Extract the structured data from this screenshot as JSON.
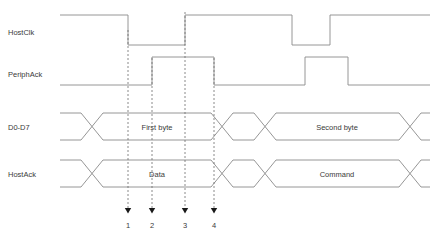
{
  "diagram": {
    "type": "timing-diagram",
    "width": 430,
    "height": 240,
    "background_color": "#ffffff",
    "wave_color": "#8a8a8a",
    "text_color": "#3a3a3a",
    "marker_color": "#6d6d6d",
    "signals": [
      {
        "name": "HostClk",
        "label": "HostClk",
        "kind": "clock",
        "high_y": 15,
        "low_y": 45,
        "start_x": 60,
        "end_x": 430,
        "initial_level": "high",
        "transitions": [
          {
            "x": 128,
            "to": "low",
            "at_marker": 1
          },
          {
            "x": 185,
            "to": "high",
            "at_marker": 3
          },
          {
            "x": 292,
            "to": "low"
          },
          {
            "x": 330,
            "to": "high"
          }
        ]
      },
      {
        "name": "PeriphAck",
        "label": "PeriphAck",
        "kind": "level",
        "high_y": 57,
        "low_y": 85,
        "start_x": 60,
        "end_x": 430,
        "initial_level": "low",
        "transitions": [
          {
            "x": 152,
            "to": "high",
            "at_marker": 2
          },
          {
            "x": 214,
            "to": "low",
            "at_marker": 4
          },
          {
            "x": 305,
            "to": "high"
          },
          {
            "x": 348,
            "to": "low"
          }
        ]
      },
      {
        "name": "D0-D7",
        "label": "D0-D7",
        "kind": "bus",
        "top_y": 113,
        "bottom_y": 140,
        "start_x": 60,
        "end_x": 430,
        "crossings": [
          92,
          222,
          265,
          410
        ],
        "segments": [
          {
            "label": "",
            "center_x": 76
          },
          {
            "label": "First byte",
            "center_x": 157
          },
          {
            "label": "",
            "center_x": 243
          },
          {
            "label": "Second byte",
            "center_x": 337
          }
        ]
      },
      {
        "name": "HostAck",
        "label": "HostAck",
        "kind": "bus",
        "top_y": 160,
        "bottom_y": 187,
        "start_x": 60,
        "end_x": 430,
        "crossings": [
          92,
          222,
          265,
          410
        ],
        "segments": [
          {
            "label": "",
            "center_x": 76
          },
          {
            "label": "Data",
            "center_x": 157
          },
          {
            "label": "",
            "center_x": 243
          },
          {
            "label": "Command",
            "center_x": 337
          }
        ]
      }
    ],
    "markers": [
      {
        "number": "1",
        "x": 128,
        "top_y": 30,
        "bottom_y": 208,
        "label_y": 228
      },
      {
        "number": "2",
        "x": 152,
        "top_y": 58,
        "bottom_y": 208,
        "label_y": 228
      },
      {
        "number": "3",
        "x": 185,
        "top_y": 12,
        "bottom_y": 208,
        "label_y": 228
      },
      {
        "number": "4",
        "x": 214,
        "top_y": 58,
        "bottom_y": 208,
        "label_y": 228
      }
    ],
    "signal_label_positions": [
      {
        "x": 8,
        "y": 35,
        "text": "HostClk"
      },
      {
        "x": 8,
        "y": 77,
        "text": "PeriphAck"
      },
      {
        "x": 8,
        "y": 130,
        "text": "D0-D7"
      },
      {
        "x": 8,
        "y": 177,
        "text": "HostAck"
      }
    ]
  }
}
